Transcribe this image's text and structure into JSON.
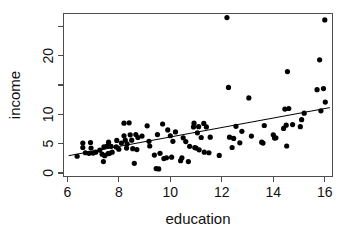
{
  "chart_data": {
    "type": "scatter",
    "title": "",
    "xlabel": "education",
    "ylabel": "income",
    "xlim": [
      5.85,
      16.3
    ],
    "ylim": [
      -0.6,
      27.2
    ],
    "xticks": [
      6,
      8,
      10,
      12,
      14,
      16
    ],
    "xticklabels": [
      "6",
      "8",
      "10",
      "12",
      "14",
      "16"
    ],
    "yticks": [
      0,
      5,
      10,
      15,
      20,
      25
    ],
    "yticklabels": [
      "0",
      "5",
      "10",
      "",
      "20",
      ""
    ],
    "grid": false,
    "legend": null,
    "point_color": "#000000",
    "point_size": 2.6,
    "line_color": "#000000",
    "frame_color": "#4d4d4d",
    "background": "#ffffff",
    "fit_line": {
      "type": "linear-regression",
      "x_start": 6.05,
      "y_start": 2.95,
      "x_end": 16.2,
      "y_end": 11.15
    },
    "points": [
      [
        6.38,
        2.85
      ],
      [
        6.6,
        5.1
      ],
      [
        6.6,
        4.35
      ],
      [
        6.7,
        3.45
      ],
      [
        6.84,
        3.35
      ],
      [
        6.9,
        5.2
      ],
      [
        6.92,
        4.25
      ],
      [
        7.0,
        3.4
      ],
      [
        7.1,
        3.55
      ],
      [
        7.26,
        3.9
      ],
      [
        7.35,
        3.2
      ],
      [
        7.4,
        1.95
      ],
      [
        7.42,
        4.45
      ],
      [
        7.45,
        2.95
      ],
      [
        7.54,
        4.6
      ],
      [
        7.58,
        3.3
      ],
      [
        7.6,
        5.25
      ],
      [
        7.64,
        3.35
      ],
      [
        7.7,
        4.55
      ],
      [
        7.74,
        3.55
      ],
      [
        7.9,
        4.45
      ],
      [
        7.92,
        5.55
      ],
      [
        8.0,
        4.05
      ],
      [
        8.1,
        5.1
      ],
      [
        8.2,
        8.5
      ],
      [
        8.2,
        6.35
      ],
      [
        8.25,
        5.6
      ],
      [
        8.3,
        4.25
      ],
      [
        8.32,
        4.95
      ],
      [
        8.4,
        8.55
      ],
      [
        8.44,
        6.5
      ],
      [
        8.5,
        5.6
      ],
      [
        8.54,
        4.15
      ],
      [
        8.6,
        1.65
      ],
      [
        8.66,
        6.55
      ],
      [
        8.7,
        4.0
      ],
      [
        8.74,
        6.05
      ],
      [
        8.9,
        6.3
      ],
      [
        9.1,
        8.05
      ],
      [
        9.17,
        5.4
      ],
      [
        9.2,
        4.6
      ],
      [
        9.38,
        3.05
      ],
      [
        9.45,
        0.75
      ],
      [
        9.5,
        6.55
      ],
      [
        9.55,
        0.7
      ],
      [
        9.6,
        3.35
      ],
      [
        9.7,
        8.35
      ],
      [
        9.75,
        2.45
      ],
      [
        9.85,
        2.6
      ],
      [
        9.9,
        7.35
      ],
      [
        10.0,
        6.35
      ],
      [
        10.05,
        2.7
      ],
      [
        10.1,
        5.4
      ],
      [
        10.2,
        7.0
      ],
      [
        10.4,
        2.1
      ],
      [
        10.45,
        2.6
      ],
      [
        10.5,
        6.0
      ],
      [
        10.6,
        5.35
      ],
      [
        10.7,
        1.95
      ],
      [
        10.75,
        4.55
      ],
      [
        10.9,
        7.85
      ],
      [
        10.92,
        8.5
      ],
      [
        10.95,
        4.35
      ],
      [
        11.0,
        4.25
      ],
      [
        11.05,
        6.85
      ],
      [
        11.1,
        7.9
      ],
      [
        11.12,
        3.95
      ],
      [
        11.2,
        6.05
      ],
      [
        11.3,
        8.45
      ],
      [
        11.32,
        3.55
      ],
      [
        11.4,
        7.85
      ],
      [
        11.5,
        3.45
      ],
      [
        11.55,
        6.1
      ],
      [
        11.9,
        3.0
      ],
      [
        12.2,
        26.5
      ],
      [
        12.26,
        14.6
      ],
      [
        12.3,
        6.1
      ],
      [
        12.4,
        4.35
      ],
      [
        12.46,
        5.9
      ],
      [
        12.55,
        7.95
      ],
      [
        12.7,
        5.15
      ],
      [
        12.78,
        7.1
      ],
      [
        13.05,
        12.8
      ],
      [
        13.15,
        6.3
      ],
      [
        13.55,
        5.25
      ],
      [
        13.6,
        5.1
      ],
      [
        13.65,
        8.1
      ],
      [
        14.0,
        6.5
      ],
      [
        14.05,
        5.95
      ],
      [
        14.1,
        6.0
      ],
      [
        14.4,
        7.6
      ],
      [
        14.45,
        10.9
      ],
      [
        14.5,
        8.15
      ],
      [
        14.52,
        4.6
      ],
      [
        14.55,
        17.3
      ],
      [
        14.6,
        11.0
      ],
      [
        14.75,
        8.25
      ],
      [
        15.05,
        7.9
      ],
      [
        15.1,
        9.1
      ],
      [
        15.2,
        10.2
      ],
      [
        15.7,
        14.2
      ],
      [
        15.8,
        19.3
      ],
      [
        15.85,
        10.6
      ],
      [
        15.95,
        14.4
      ],
      [
        16.0,
        26.1
      ],
      [
        16.02,
        12.1
      ]
    ]
  }
}
